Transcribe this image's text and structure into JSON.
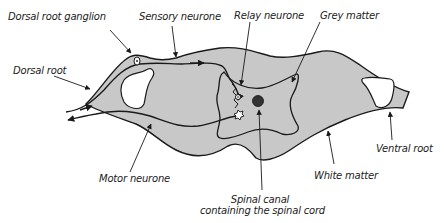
{
  "diagram": {
    "colors": {
      "white_matter_fill": "#c8c8c8",
      "outline": "#1a1a1a",
      "background": "#ffffff",
      "label_text": "#222222"
    },
    "labels": {
      "dorsal_root_ganglion": "Dorsal root ganglion",
      "sensory_neurone": "Sensory neurone",
      "relay_neurone": "Relay neurone",
      "grey_matter": "Grey matter",
      "dorsal_root": "Dorsal root",
      "ventral_root": "Ventral root",
      "motor_neurone": "Motor neurone",
      "white_matter": "White matter",
      "spinal_canal_line1": "Spinal canal",
      "spinal_canal_line2": "containing the spinal cord"
    }
  }
}
